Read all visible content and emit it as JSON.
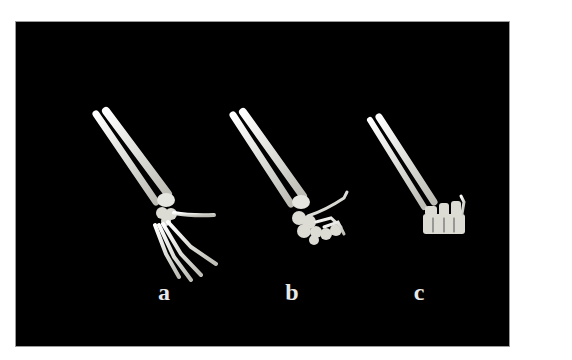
{
  "figure": {
    "background": "#000000",
    "bone_color": "#e6e6e0",
    "panels": [
      {
        "id": "a",
        "label": "a",
        "description": "forearm with open, extended hand"
      },
      {
        "id": "b",
        "label": "b",
        "description": "forearm with partially flexed hand"
      },
      {
        "id": "c",
        "label": "c",
        "description": "forearm with fully flexed hand (fist)"
      }
    ]
  }
}
